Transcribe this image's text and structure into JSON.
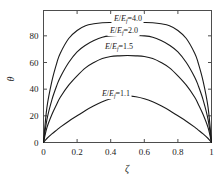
{
  "chart_data": {
    "type": "line",
    "title": "",
    "subtitle": "",
    "xlabel": "ζ",
    "ylabel": "θ",
    "xlim": [
      0,
      1
    ],
    "ylim": [
      0,
      99
    ],
    "grid": false,
    "legend_position": "inline-on-curve",
    "xticks": [
      "0",
      "0.2",
      "0.4",
      "0.6",
      "0.8",
      "1"
    ],
    "xtick_values": [
      0,
      0.2,
      0.4,
      0.6,
      0.8,
      1
    ],
    "yticks": [
      "0",
      "20",
      "40",
      "60",
      "80"
    ],
    "ytick_values": [
      0,
      20,
      40,
      60,
      80
    ],
    "x": [
      0,
      0.02,
      0.05,
      0.08,
      0.1,
      0.15,
      0.2,
      0.25,
      0.3,
      0.35,
      0.4,
      0.45,
      0.5,
      0.55,
      0.6,
      0.65,
      0.7,
      0.75,
      0.8,
      0.85,
      0.9,
      0.92,
      0.95,
      0.98,
      1
    ],
    "series": [
      {
        "name": "E/Ef=4.0",
        "label_html": "<tspan class=\"ital\">E</tspan>/<tspan class=\"ital\">E</tspan><tspan class=\"sub\" dy=\"1.6\">f</tspan><tspan dy=\"-1.6\">=4.0</tspan>",
        "ratio": 4.0,
        "peak": 90,
        "values": [
          0,
          26,
          46,
          60,
          67,
          78,
          84,
          87.5,
          89,
          89.8,
          90,
          90,
          90,
          90,
          90,
          89.8,
          89,
          87.5,
          84,
          78,
          67,
          60,
          46,
          26,
          0
        ]
      },
      {
        "name": "E/Ef=2.0",
        "label_html": "<tspan class=\"ital\">E</tspan>/<tspan class=\"ital\">E</tspan><tspan class=\"sub\" dy=\"1.6\">f</tspan><tspan dy=\"-1.6\">=2.0</tspan>",
        "ratio": 2.0,
        "peak": 80,
        "values": [
          0,
          17,
          32,
          43,
          49,
          60,
          68,
          73,
          76.5,
          79,
          80,
          80.3,
          80.4,
          80.3,
          80,
          79,
          76.5,
          73,
          68,
          60,
          49,
          43,
          32,
          17,
          0
        ]
      },
      {
        "name": "E/Ef=1.5",
        "label_html": "<tspan class=\"ital\">E</tspan>/<tspan class=\"ital\">E</tspan><tspan class=\"sub\" dy=\"1.6\">f</tspan><tspan dy=\"-1.6\">=1.5</tspan>",
        "ratio": 1.5,
        "peak": 65,
        "values": [
          0,
          11,
          21,
          29,
          34,
          43,
          50,
          56,
          60,
          63,
          64.5,
          65,
          65.2,
          65,
          64.5,
          63,
          60,
          56,
          50,
          43,
          34,
          29,
          21,
          11,
          0
        ]
      },
      {
        "name": "E/Ef=1.1",
        "label_html": "<tspan class=\"ital\">E</tspan>/<tspan class=\"ital\">E</tspan><tspan class=\"sub\" dy=\"1.6\">f</tspan><tspan dy=\"-1.6\">=1.1</tspan>",
        "ratio": 1.1,
        "peak": 35,
        "values": [
          0,
          3,
          6.5,
          9.5,
          11.5,
          16,
          20,
          24,
          27.5,
          30.5,
          32.8,
          34.3,
          35,
          34.3,
          32.8,
          30.5,
          27.5,
          24,
          20,
          16,
          11.5,
          9.5,
          6.5,
          3,
          0
        ]
      }
    ],
    "colors": {
      "curve": "#1a1a1a",
      "axis": "#4d4d4d",
      "text": "#1a1a1a",
      "background": "#ffffff"
    }
  },
  "labels": {
    "curve_label_positions": [
      {
        "x": 128,
        "y": 21
      },
      {
        "x": 124,
        "y": 33
      },
      {
        "x": 119,
        "y": 49
      },
      {
        "x": 116,
        "y": 96
      }
    ]
  }
}
